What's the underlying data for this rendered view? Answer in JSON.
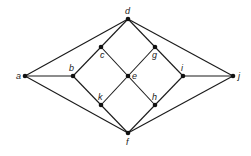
{
  "diagram": {
    "type": "graph",
    "nodes": [
      {
        "id": "a",
        "label": "a",
        "x": 25,
        "y": 76,
        "lx": -9,
        "ly": 3
      },
      {
        "id": "b",
        "label": "b",
        "x": 73,
        "y": 76,
        "lx": -4,
        "ly": -5
      },
      {
        "id": "c",
        "label": "c",
        "x": 101,
        "y": 47,
        "lx": -1,
        "ly": 11
      },
      {
        "id": "d",
        "label": "d",
        "x": 128,
        "y": 19,
        "lx": -3,
        "ly": -5
      },
      {
        "id": "e",
        "label": "e",
        "x": 128,
        "y": 76,
        "lx": 4,
        "ly": 3
      },
      {
        "id": "g",
        "label": "g",
        "x": 155,
        "y": 47,
        "lx": -3,
        "ly": 11
      },
      {
        "id": "i",
        "label": "i",
        "x": 183,
        "y": 76,
        "lx": -2,
        "ly": -5
      },
      {
        "id": "j",
        "label": "j",
        "x": 233,
        "y": 76,
        "lx": 5,
        "ly": 3
      },
      {
        "id": "k",
        "label": "k",
        "x": 101,
        "y": 105,
        "lx": -3,
        "ly": -5
      },
      {
        "id": "h",
        "label": "h",
        "x": 155,
        "y": 105,
        "lx": -3,
        "ly": -5
      },
      {
        "id": "f",
        "label": "f",
        "x": 128,
        "y": 133,
        "lx": -2,
        "ly": 12
      }
    ],
    "edges": [
      [
        "a",
        "d"
      ],
      [
        "a",
        "b"
      ],
      [
        "a",
        "f"
      ],
      [
        "b",
        "c"
      ],
      [
        "b",
        "k"
      ],
      [
        "c",
        "d"
      ],
      [
        "c",
        "e"
      ],
      [
        "d",
        "g"
      ],
      [
        "d",
        "j"
      ],
      [
        "g",
        "e"
      ],
      [
        "g",
        "i"
      ],
      [
        "e",
        "k"
      ],
      [
        "e",
        "h"
      ],
      [
        "k",
        "f"
      ],
      [
        "h",
        "f"
      ],
      [
        "h",
        "i"
      ],
      [
        "i",
        "j"
      ],
      [
        "j",
        "f"
      ]
    ]
  }
}
